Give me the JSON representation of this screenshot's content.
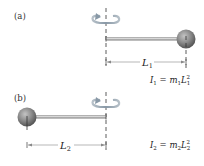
{
  "panels": [
    {
      "label": "(a)",
      "length_symbol": "L",
      "length_subscript": "1",
      "equation": {
        "lhs": "I",
        "lhs_sub": "1",
        "equals": " = ",
        "mass": "m",
        "mass_sub": "1",
        "length": "L",
        "length_sub": "1",
        "exponent": "2"
      },
      "mass_position": "right end of rod, at distance L1 from axis"
    },
    {
      "label": "(b)",
      "length_symbol": "L",
      "length_subscript": "2",
      "equation": {
        "lhs": "I",
        "lhs_sub": "2",
        "equals": " = ",
        "mass": "m",
        "mass_sub": "2",
        "length": "L",
        "length_sub": "2",
        "exponent": "2"
      },
      "mass_position": "left end of rod, at distance L2 from axis"
    }
  ],
  "colors": {
    "rod": "#8c8c8c",
    "rod_highlight": "#d0d0d0",
    "ball": "#8a8a8a",
    "ball_dark": "#555555",
    "axis": "#333333",
    "rotation_arrow": "#8a9aa8",
    "dimension_line": "#888888"
  }
}
